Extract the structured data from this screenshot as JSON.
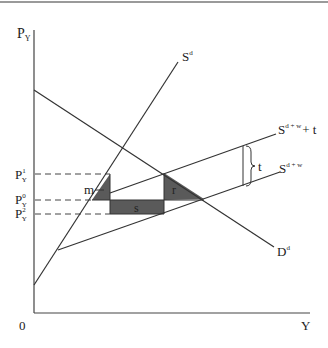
{
  "diagram": {
    "type": "supply-demand",
    "axes": {
      "y_label": "P",
      "y_label_sub": "Y",
      "x_label": "Y",
      "origin_label": "0"
    },
    "price_levels": [
      {
        "name": "P",
        "sub": "Y",
        "sup": "1",
        "y": 174
      },
      {
        "name": "P",
        "sub": "Y",
        "sup": "0",
        "y": 200
      },
      {
        "name": "P",
        "sub": "Y",
        "sup": "2",
        "y": 214
      }
    ],
    "curves": {
      "demand": {
        "label": "D",
        "sup": "d"
      },
      "domestic_supply": {
        "label": "S",
        "sup": "d"
      },
      "total_supply": {
        "label": "S",
        "sup": "d + w"
      },
      "total_supply_tariff": {
        "label": "S",
        "sup": "d + w",
        "suffix": "+ t"
      }
    },
    "areas": {
      "m": "m",
      "s": "s",
      "r": "r"
    },
    "tariff_brace_label": "t",
    "colors": {
      "line": "#333333",
      "shade": "#5a5a5a",
      "border": "#9a9a9a"
    }
  }
}
